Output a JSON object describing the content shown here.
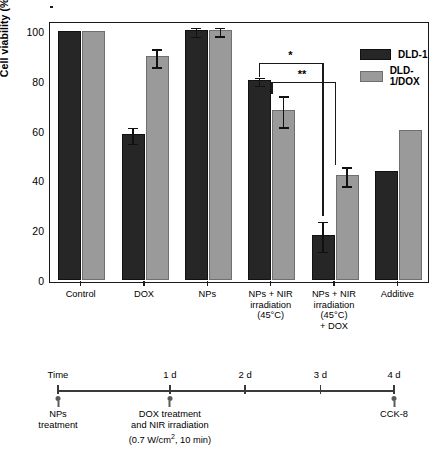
{
  "chart_data": {
    "type": "bar",
    "title": "",
    "xlabel": "",
    "ylabel": "Cell viability (%)",
    "ylim": [
      0,
      110
    ],
    "yticks": [
      0,
      20,
      40,
      60,
      80,
      100
    ],
    "grid": false,
    "legend_position": "top-right",
    "categories": [
      "Control",
      "DOX",
      "NPs",
      "NPs + NIR\nirradiation\n(45°C)",
      "NPs + NIR\nirradiation\n(45°C)\n+ DOX",
      "Additive"
    ],
    "category_lines": [
      [
        "Control"
      ],
      [
        "DOX"
      ],
      [
        "NPs"
      ],
      [
        "NPs + NIR",
        "irradiation",
        "(45°C)"
      ],
      [
        "NPs + NIR",
        "irradiation",
        "(45°C)",
        "+ DOX"
      ],
      [
        "Additive"
      ]
    ],
    "series": [
      {
        "name": "DLD-1",
        "color": "#262626",
        "values": [
          100,
          58.8,
          100.3,
          80.3,
          18.2,
          43.8
        ],
        "errors": [
          0,
          3.2,
          1.9,
          1.6,
          6.0,
          0
        ]
      },
      {
        "name": "DLD-1/DOX",
        "color": "#9a9a9a",
        "values": [
          100,
          89.8,
          100.4,
          68.3,
          42.2,
          60.3
        ],
        "errors": [
          0,
          3.6,
          1.7,
          6.2,
          3.8,
          0
        ]
      }
    ],
    "annotations": [
      {
        "label": "*",
        "from": "NPs + NIR irradiation (45°C) : DLD-1",
        "to": "NPs + NIR irradiation (45°C) + DOX : DLD-1"
      },
      {
        "label": "**",
        "from": "NPs + NIR irradiation (45°C) : DLD-1/DOX",
        "to": "NPs + NIR irradiation (45°C) + DOX : DLD-1/DOX"
      }
    ]
  },
  "legend": {
    "items": [
      {
        "label": "DLD-1",
        "color": "#262626"
      },
      {
        "label": "DLD-1/DOX",
        "color": "#9a9a9a"
      }
    ]
  },
  "timeline": {
    "axis_label": "Time",
    "ticks": [
      {
        "label": "1 d",
        "position": 0
      },
      {
        "label": "2 d",
        "position": 1
      },
      {
        "label": "3 d",
        "position": 2
      },
      {
        "label": "4 d",
        "position": 3
      }
    ],
    "events": [
      {
        "lines": [
          "NPs",
          "treatment"
        ]
      },
      {
        "lines": [
          "DOX treatment",
          "and NIR irradiation",
          "(0.7 W/cm², 10 min)"
        ]
      },
      {
        "lines": [
          "CCK-8"
        ]
      }
    ]
  },
  "colors": {
    "dark_bar": "#262626",
    "gray_bar": "#9a9a9a",
    "axis": "#1a1a1a",
    "timeline_axis": "#3a3a3a",
    "background": "#ffffff"
  }
}
